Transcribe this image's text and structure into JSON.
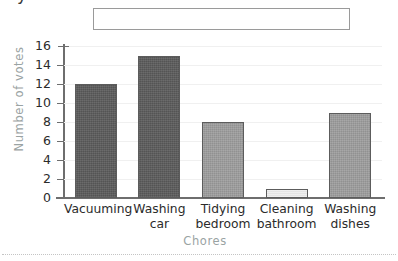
{
  "page": {
    "top_fragment_glyph": "y",
    "answer_box_value": "",
    "answer_box_placeholder": ""
  },
  "chart_data": {
    "type": "bar",
    "title": "",
    "xlabel": "Chores",
    "ylabel": "Number of votes",
    "categories": [
      "Vacuuming",
      "Washing car",
      "Tidying bedroom",
      "Cleaning bathroom",
      "Washing dishes"
    ],
    "category_lines": [
      [
        "Vacuuming"
      ],
      [
        "Washing",
        "car"
      ],
      [
        "Tidying",
        "bedroom"
      ],
      [
        "Cleaning",
        "bathroom"
      ],
      [
        "Washing",
        "dishes"
      ]
    ],
    "values": [
      12,
      15,
      8,
      1,
      9
    ],
    "bar_colors": [
      "#5d5d5d",
      "#5d5d5d",
      "#9d9d9d",
      "#e9e9e9",
      "#9d9d9d"
    ],
    "bar_border_color": "#5c5c5c",
    "ylim": [
      0,
      16
    ],
    "ytick_step": 2,
    "yticks": [
      0,
      2,
      4,
      6,
      8,
      10,
      12,
      14,
      16
    ],
    "ytick_labels": [
      "0",
      "2",
      "4",
      "6",
      "8",
      "10",
      "12",
      "14",
      "16"
    ],
    "grid": true,
    "grid_color": "#f0f0f0",
    "axis_color": "#6e6e6e",
    "axis_title_color": "#9aa3a3",
    "legend": null
  }
}
